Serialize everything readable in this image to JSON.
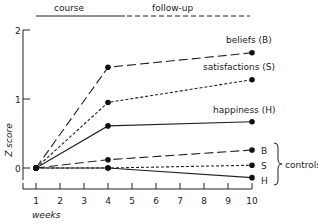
{
  "chart_data": {
    "type": "line",
    "title": "",
    "xlabel": "weeks",
    "ylabel": "Z score",
    "x_ticks": [
      "1",
      "2",
      "3",
      "4",
      "5",
      "6",
      "7",
      "8",
      "9",
      "10"
    ],
    "y_ticks": [
      "0",
      "1",
      "2"
    ],
    "ylim": [
      -0.4,
      2
    ],
    "xlim": [
      1,
      10
    ],
    "grid": false,
    "phase_labels": {
      "course": "course",
      "followup": "follow-up"
    },
    "x": [
      1,
      4,
      10
    ],
    "series": [
      {
        "name": "beliefs (B)",
        "group": "treatment",
        "style": "long-dash",
        "values": [
          0,
          1.46,
          1.67
        ]
      },
      {
        "name": "satisfactions (S)",
        "group": "treatment",
        "style": "short-dash",
        "values": [
          0,
          0.95,
          1.28
        ]
      },
      {
        "name": "happiness (H)",
        "group": "treatment",
        "style": "solid",
        "values": [
          0,
          0.61,
          0.67
        ]
      },
      {
        "name": "B",
        "group": "controls",
        "style": "long-dash",
        "values": [
          0,
          0.12,
          0.26
        ]
      },
      {
        "name": "S",
        "group": "controls",
        "style": "short-dash",
        "values": [
          0,
          0.0,
          0.04
        ]
      },
      {
        "name": "H",
        "group": "controls",
        "style": "solid",
        "values": [
          0,
          0.0,
          -0.14
        ]
      }
    ],
    "annotations": {
      "controls_brace": "controls"
    }
  }
}
